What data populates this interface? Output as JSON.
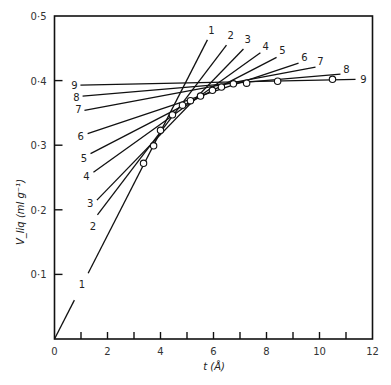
{
  "chart_data": {
    "type": "line",
    "title": "",
    "xlabel": "t (Å)",
    "ylabel": "V_liq (ml g⁻¹)",
    "xlim": [
      0,
      12
    ],
    "ylim": [
      0,
      0.5
    ],
    "grid": false,
    "x_ticks": [
      "0",
      "2",
      "4",
      "6",
      "8",
      "10",
      "12"
    ],
    "y_ticks": [
      "0·1",
      "0·2",
      "0·3",
      "0·4",
      "0·5"
    ],
    "y_tick_values": [
      0.1,
      0.2,
      0.3,
      0.4,
      0.5
    ],
    "x_tick_values": [
      0,
      2,
      4,
      6,
      8,
      10,
      12
    ],
    "x_minor_ticks": [
      1,
      3,
      5,
      7,
      9,
      11
    ],
    "points": {
      "name": "experimental",
      "marker": "open-circle",
      "x": [
        3.36,
        3.74,
        4.0,
        4.45,
        4.83,
        5.13,
        5.51,
        5.96,
        6.3,
        6.75,
        7.25,
        8.42,
        10.49
      ],
      "y": [
        0.272,
        0.299,
        0.323,
        0.347,
        0.362,
        0.369,
        0.376,
        0.385,
        0.39,
        0.395,
        0.396,
        0.399,
        0.402
      ]
    },
    "series": [
      {
        "name": "1",
        "x": [
          0,
          5.77
        ],
        "y": [
          0,
          0.463
        ],
        "label_start": [
          1.0,
          0.085
        ],
        "label_end": [
          5.85,
          0.475
        ]
      },
      {
        "name": "2",
        "x": [
          1.62,
          6.49
        ],
        "y": [
          0.192,
          0.455
        ],
        "label_start": [
          1.53,
          0.175
        ],
        "label_end": [
          6.57,
          0.467
        ]
      },
      {
        "name": "3",
        "x": [
          1.6,
          7.13
        ],
        "y": [
          0.215,
          0.449
        ],
        "label_start": [
          1.42,
          0.21
        ],
        "label_end": [
          7.21,
          0.461
        ]
      },
      {
        "name": "4",
        "x": [
          1.47,
          7.77
        ],
        "y": [
          0.258,
          0.443
        ],
        "label_start": [
          1.28,
          0.253
        ],
        "label_end": [
          7.89,
          0.451
        ]
      },
      {
        "name": "5",
        "x": [
          1.36,
          8.38
        ],
        "y": [
          0.287,
          0.436
        ],
        "label_start": [
          1.19,
          0.28
        ],
        "label_end": [
          8.53,
          0.444
        ]
      },
      {
        "name": "6",
        "x": [
          1.25,
          9.21
        ],
        "y": [
          0.318,
          0.427
        ],
        "label_start": [
          1.06,
          0.314
        ],
        "label_end": [
          9.36,
          0.433
        ]
      },
      {
        "name": "7",
        "x": [
          1.13,
          9.85
        ],
        "y": [
          0.354,
          0.421
        ],
        "label_start": [
          0.98,
          0.356
        ],
        "label_end": [
          9.96,
          0.427
        ]
      },
      {
        "name": "8",
        "x": [
          1.06,
          10.79
        ],
        "y": [
          0.376,
          0.41
        ],
        "label_start": [
          0.9,
          0.375
        ],
        "label_end": [
          10.94,
          0.415
        ]
      },
      {
        "name": "9",
        "x": [
          0.98,
          11.36
        ],
        "y": [
          0.393,
          0.402
        ],
        "label_start": [
          0.83,
          0.393
        ],
        "label_end": [
          11.58,
          0.4
        ]
      }
    ]
  }
}
